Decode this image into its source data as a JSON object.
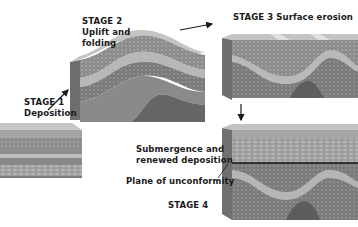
{
  "diagram": {
    "colors": {
      "background": "#ffffff",
      "text": "#1a1a1a",
      "top_surface": "#c9c9c9",
      "front_face": "#8f8f8f",
      "side_face": "#7a7a7a",
      "light_band": "#b8b8b8",
      "dark_band": "#777777",
      "conglomerate": "#9a9a9a",
      "unconformity_line": "#333333"
    },
    "stages": [
      {
        "id": "stage1",
        "label": "STAGE 1",
        "caption": "Deposition"
      },
      {
        "id": "stage2",
        "label": "STAGE 2",
        "caption_line1": "Uplift and",
        "caption_line2": "folding"
      },
      {
        "id": "stage3",
        "label": "STAGE 3 Surface erosion"
      },
      {
        "id": "stage4",
        "label": "STAGE 4",
        "annotations": {
          "deposition_line1": "Submergence and",
          "deposition_line2": "renewed deposition",
          "unconformity": "Plane of unconformity"
        }
      }
    ],
    "arrows": [
      {
        "from": "stage1",
        "to": "stage2",
        "name": "arrow-stage1-to-stage2"
      },
      {
        "from": "stage2",
        "to": "stage3",
        "name": "arrow-stage2-to-stage3"
      },
      {
        "from": "stage3",
        "to": "stage4",
        "name": "arrow-stage3-to-stage4"
      }
    ]
  }
}
